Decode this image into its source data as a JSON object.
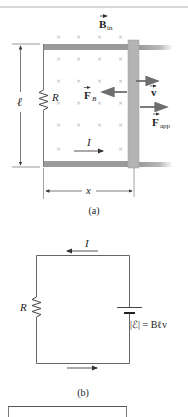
{
  "figure_a": {
    "caption": "(a)",
    "field_label": "B",
    "field_subscript": "in",
    "resistor_label": "R",
    "length_label": "ℓ",
    "force_b_label": "F",
    "force_b_subscript": "B",
    "velocity_label": "v",
    "force_app_label": "F",
    "force_app_subscript": "app",
    "current_label": "I",
    "distance_label": "x"
  },
  "figure_b": {
    "caption": "(b)",
    "current_label": "I",
    "resistor_label": "R",
    "emf_label": "|ℰ| = Bℓv"
  },
  "colors": {
    "rail": "#9a9a9a",
    "bar": "#b3b3b3",
    "wire": "#666666",
    "arrow": "#6e6e6e",
    "field_x": "#b0b0b0",
    "text": "#222222"
  }
}
